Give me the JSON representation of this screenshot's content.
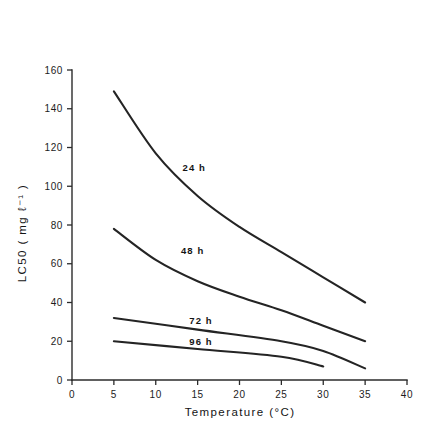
{
  "chart_data": {
    "type": "line",
    "title": "",
    "xlabel": "Temperature  (°C)",
    "ylabel": "LC50 ( mg ℓ⁻¹ )",
    "xlim": [
      0,
      40
    ],
    "ylim": [
      0,
      160
    ],
    "xticks": [
      0,
      5,
      10,
      15,
      20,
      25,
      30,
      35,
      40
    ],
    "xtick_labels": [
      "0",
      "5",
      "10",
      "15",
      "20",
      "25",
      "30",
      "35",
      "40"
    ],
    "yticks": [
      0,
      20,
      40,
      60,
      80,
      100,
      120,
      140,
      160
    ],
    "ytick_labels": [
      "0",
      "20",
      "40",
      "60",
      "80",
      "100",
      "120",
      "140",
      "160"
    ],
    "grid": false,
    "legend_position": "inline-annotations",
    "series": [
      {
        "name": "24 h",
        "label": "24 h",
        "label_x": 13.2,
        "label_y": 108,
        "x": [
          5,
          10,
          15,
          20,
          25,
          30,
          35
        ],
        "values": [
          149,
          117,
          95,
          79,
          66,
          53,
          40
        ]
      },
      {
        "name": "48 h",
        "label": "48 h",
        "label_x": 13.0,
        "label_y": 65,
        "x": [
          5,
          10,
          15,
          20,
          25,
          30,
          35
        ],
        "values": [
          78,
          62,
          51,
          43,
          36,
          28,
          20
        ]
      },
      {
        "name": "72 h",
        "label": "72 h",
        "label_x": 14.0,
        "label_y": 29,
        "x": [
          5,
          15,
          25,
          30,
          35
        ],
        "values": [
          32,
          26,
          20,
          15,
          6
        ]
      },
      {
        "name": "96 h",
        "label": "96 h",
        "label_x": 14.0,
        "label_y": 18,
        "x": [
          5,
          15,
          25,
          30
        ],
        "values": [
          20,
          16,
          12,
          7
        ]
      }
    ]
  },
  "style": {
    "axis_color": "#2b2b2b",
    "curve_color": "#242424",
    "text_color": "#141414",
    "background": "#ffffff"
  }
}
